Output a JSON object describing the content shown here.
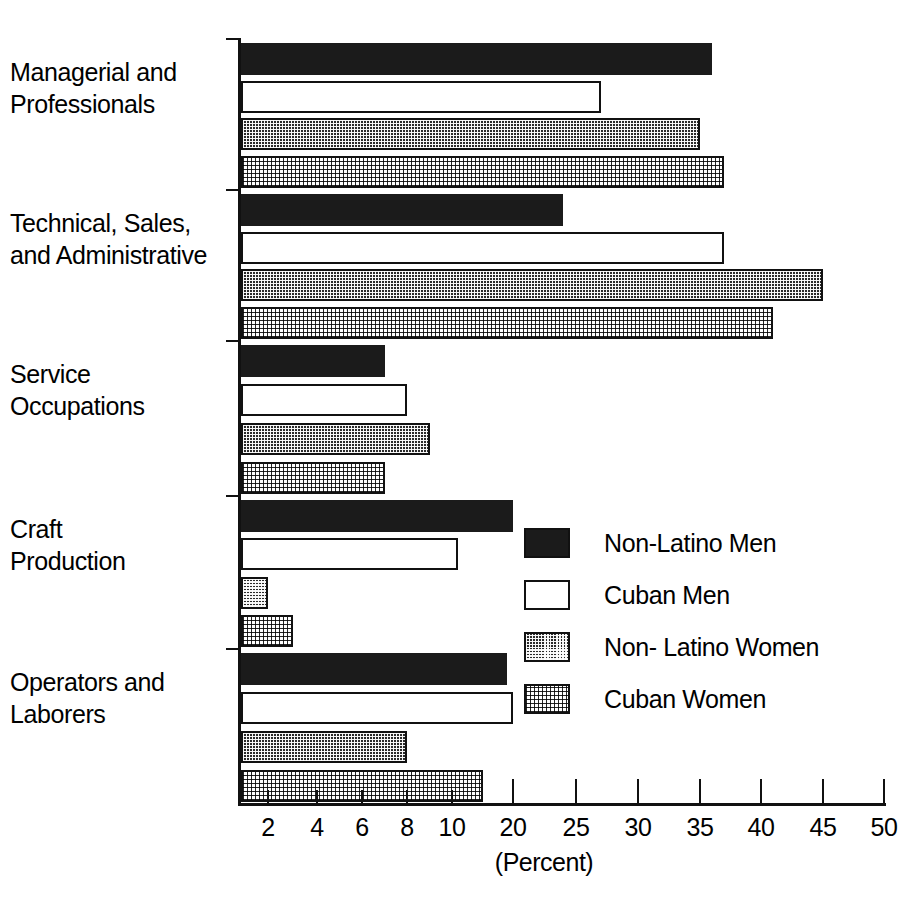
{
  "chart_data": {
    "type": "bar",
    "orientation": "horizontal",
    "title": "",
    "xlabel": "(Percent)",
    "ylabel": "",
    "grid": false,
    "legend_position": "inside-center-right",
    "axis_note": "non-linear x axis: 2,4,6,8,10 then 20,25,30,35,40,45,50",
    "xticks": [
      2,
      4,
      6,
      8,
      10,
      20,
      25,
      30,
      35,
      40,
      45,
      50
    ],
    "xtick_labels": [
      "2",
      "4",
      "6",
      "8",
      "10",
      "20",
      "25",
      "30",
      "35",
      "40",
      "45",
      "50"
    ],
    "xlim": [
      0,
      50
    ],
    "categories": [
      "Managerial and Professionals",
      "Technical, Sales, and Administrative",
      "Service Occupations",
      "Craft Production",
      "Operators and Laborers"
    ],
    "category_lines": [
      [
        "Managerial and",
        "Professionals"
      ],
      [
        "Technical, Sales,",
        "and Administrative"
      ],
      [
        "Service",
        "Occupations"
      ],
      [
        "Craft",
        "Production"
      ],
      [
        "Operators and",
        "Laborers"
      ]
    ],
    "series": [
      {
        "name": "Non-Latino Men",
        "fill": "solid",
        "values": [
          36,
          24,
          7,
          20,
          19
        ]
      },
      {
        "name": "Cuban Men",
        "fill": "open",
        "values": [
          27,
          37,
          8,
          11,
          20
        ]
      },
      {
        "name": "Non- Latino Women",
        "fill": "dark-dot",
        "values": [
          35,
          45,
          9,
          2,
          8
        ]
      },
      {
        "name": "Cuban Women",
        "fill": "light-dot",
        "values": [
          37,
          41,
          7,
          3,
          15
        ]
      }
    ]
  },
  "legend": {
    "items": [
      {
        "label": "Non-Latino Men",
        "fill": "solid"
      },
      {
        "label": "Cuban Men",
        "fill": "open"
      },
      {
        "label": "Non- Latino Women",
        "fill": "dark-dot"
      },
      {
        "label": "Cuban Women",
        "fill": "light-dot"
      }
    ]
  },
  "colors": {
    "ink": "#111111",
    "solid": "#1b1b1b",
    "open": "#ffffff",
    "dark_dot": "#2a2a2a",
    "light_dot": "#dcdcdc",
    "background": "#ffffff"
  }
}
